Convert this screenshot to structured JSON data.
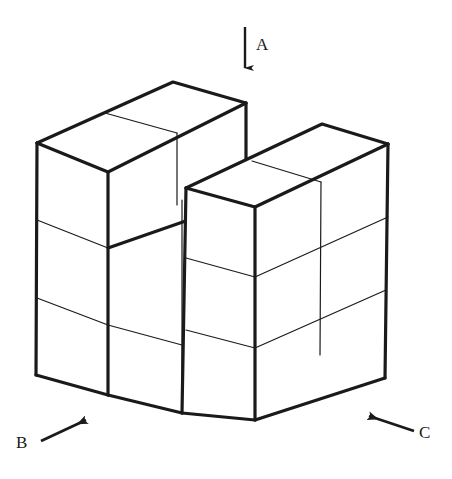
{
  "figure": {
    "type": "isometric-block-diagram",
    "background_color": "#ffffff",
    "line_color": "#1a1a1a",
    "face_color": "#ffffff",
    "heavy_stroke_width": 3.2,
    "light_stroke_width": 1.2,
    "arrows": [
      {
        "id": "arrow-a",
        "label": "A",
        "direction": "down",
        "from": [
          245,
          27
        ],
        "to": [
          245,
          78
        ],
        "label_pos": [
          256,
          50
        ]
      },
      {
        "id": "arrow-b",
        "label": "B",
        "direction": "up-right",
        "from": [
          41,
          441
        ],
        "to": [
          94,
          416
        ],
        "label_pos": [
          21,
          448
        ]
      },
      {
        "id": "arrow-c",
        "label": "C",
        "direction": "up-left",
        "from": [
          414,
          431
        ],
        "to": [
          361,
          413
        ],
        "label_pos": [
          419,
          438
        ]
      }
    ],
    "geometry": {
      "left_block": {
        "top_face": [
          [
            37,
            143
          ],
          [
            173,
            82
          ],
          [
            246,
            103
          ],
          [
            108,
            172
          ]
        ],
        "top_face_divider": [
          [
            105,
            113
          ],
          [
            177,
            133
          ]
        ],
        "left_face": [
          [
            37,
            143
          ],
          [
            108,
            172
          ],
          [
            108,
            395
          ],
          [
            36,
            375
          ]
        ],
        "left_face_dividers": [
          [
            [
              37,
              220
            ],
            [
              108,
              248
            ]
          ],
          [
            [
              37,
              298
            ],
            [
              108,
              325
            ]
          ]
        ],
        "right_vertical_edge": [
          [
            246,
            103
          ],
          [
            246,
            200
          ]
        ],
        "notch_top_edge": [
          [
            108,
            248
          ],
          [
            182,
            200
          ]
        ],
        "notch_front_edge": [
          [
            108,
            248
          ],
          [
            246,
            200
          ]
        ],
        "lower_right_face_edge": [
          [
            108,
            325
          ],
          [
            182,
            345
          ]
        ],
        "bottom_front_edge": [
          [
            36,
            375
          ],
          [
            108,
            395
          ]
        ],
        "bottom_right_edge": [
          [
            108,
            395
          ],
          [
            182,
            413
          ]
        ]
      },
      "right_block": {
        "top_face": [
          [
            186,
            188
          ],
          [
            322,
            124
          ],
          [
            388,
            144
          ],
          [
            255,
            207
          ]
        ],
        "top_face_divider": [
          [
            252,
            161
          ],
          [
            321,
            182
          ]
        ],
        "front_left_face": [
          [
            186,
            188
          ],
          [
            255,
            207
          ],
          [
            255,
            420
          ],
          [
            182,
            413
          ]
        ],
        "front_right_face": [
          [
            255,
            207
          ],
          [
            388,
            144
          ],
          [
            385,
            378
          ],
          [
            255,
            420
          ]
        ],
        "right_face_dividers": [
          [
            [
              255,
              277
            ],
            [
              388,
              217
            ]
          ],
          [
            [
              255,
              348
            ],
            [
              386,
              290
            ]
          ],
          [
            [
              186,
              258
            ],
            [
              255,
              277
            ]
          ],
          [
            [
              186,
              330
            ],
            [
              255,
              348
            ]
          ]
        ],
        "vertical_divider": [
          [
            321,
            182
          ],
          [
            320,
            355
          ]
        ]
      }
    }
  },
  "labels": {
    "a": "A",
    "b": "B",
    "c": "C"
  }
}
